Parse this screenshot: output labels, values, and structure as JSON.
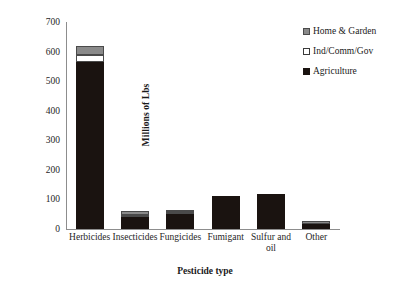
{
  "chart_data": {
    "type": "bar",
    "subtype": "stacked-bar",
    "title": "",
    "xlabel": "Pesticide type",
    "ylabel": "Millions of Lbs",
    "ylim": [
      0,
      700
    ],
    "yticks": [
      700,
      600,
      500,
      400,
      300,
      200,
      100,
      0
    ],
    "grid": false,
    "legend_position": "top-right",
    "categories": [
      "Herbicides",
      "Insecticides",
      "Fungicides",
      "Fumigant",
      "Sulfur and oil",
      "Other"
    ],
    "series": [
      {
        "name": "Agriculture",
        "color": "#1a1310",
        "values": [
          565,
          40,
          50,
          110,
          120,
          17
        ]
      },
      {
        "name": "Ind/Comm/Gov",
        "color": "#ffffff",
        "values": [
          25,
          8,
          5,
          0,
          0,
          0
        ]
      },
      {
        "name": "Home & Garden",
        "color": "#8a8a8a",
        "values": [
          30,
          12,
          8,
          0,
          0,
          10
        ]
      }
    ],
    "totals": [
      620,
      60,
      63,
      110,
      120,
      27
    ]
  },
  "axes": {
    "y_title": "Millions of Lbs",
    "x_title": "Pesticide type",
    "y_tick_labels": [
      "700",
      "600",
      "500",
      "400",
      "300",
      "200",
      "100",
      "0"
    ],
    "x_tick_labels": [
      "Herbicides",
      "Insecticides",
      "Fungicides",
      "Fumigant",
      "Sulfur and oil",
      "Other"
    ]
  },
  "legend": {
    "entries": [
      {
        "label": "Home & Garden",
        "swatch": "gray-square-swatch"
      },
      {
        "label": "Ind/Comm/Gov",
        "swatch": "white-square-swatch"
      },
      {
        "label": "Agriculture",
        "swatch": "black-square-swatch"
      }
    ]
  }
}
